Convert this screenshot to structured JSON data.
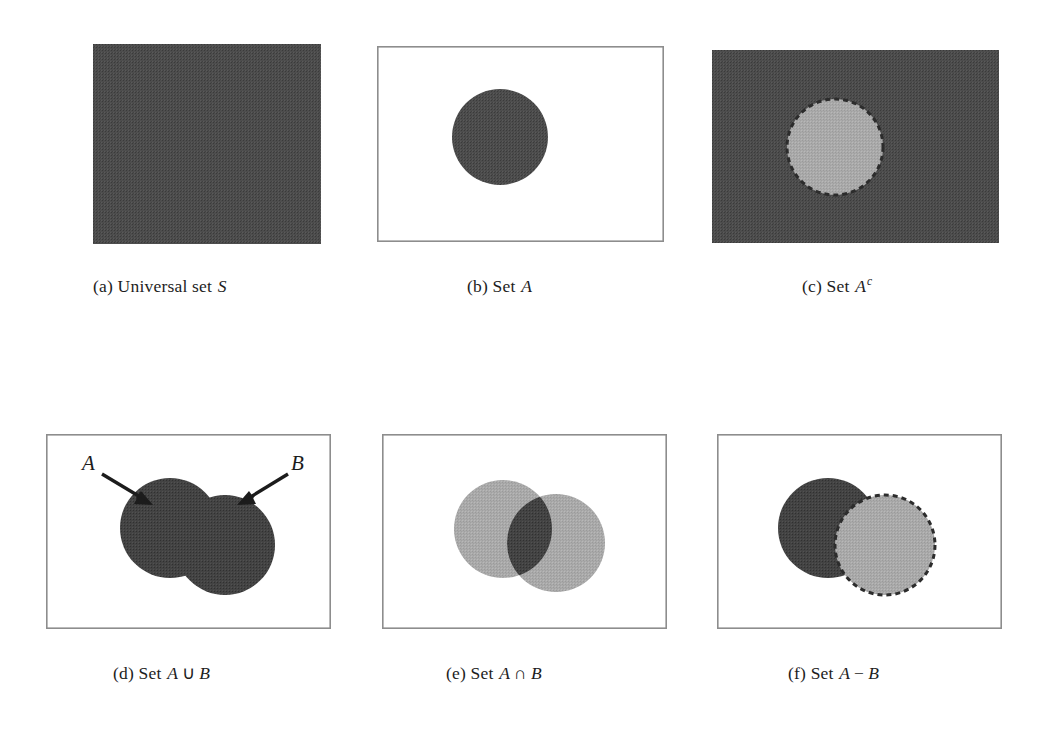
{
  "figure": {
    "panel_count": 6,
    "ink_colors": {
      "dark_fill": "#4a4a4a",
      "darker_fill": "#3d3d3d",
      "light_fill": "#a8a8a8",
      "frame": "#8f8f8f",
      "text": "#1d1d1d",
      "page": "#ffffff"
    },
    "panels": [
      {
        "key": "a",
        "caption_prefix": "(a)",
        "caption_text": "Universal set",
        "caption_symbol": "S",
        "description": "solid shaded rectangle representing the whole sample space",
        "shapes": [
          "filled-rectangle"
        ]
      },
      {
        "key": "b",
        "caption_prefix": "(b)",
        "caption_text": "Set",
        "caption_symbol": "A",
        "description": "white rectangle with one dark filled circle",
        "shapes": [
          "outlined-rectangle",
          "filled-circle-A"
        ]
      },
      {
        "key": "c",
        "caption_prefix": "(c)",
        "caption_text": "Set",
        "caption_symbol": "A",
        "caption_superscript": "c",
        "description": "shaded rectangle with a light circle cut out, dashed boundary",
        "shapes": [
          "filled-rectangle",
          "light-circle-dashed"
        ]
      },
      {
        "key": "d",
        "caption_prefix": "(d)",
        "caption_text": "Set",
        "caption_symbol": "A",
        "caption_operator": "∪",
        "caption_symbol2": "B",
        "description": "two overlapping circles both shaded dark (union), labelled with arrows",
        "shapes": [
          "outlined-rectangle",
          "filled-circle-A",
          "filled-circle-B",
          "arrow-A",
          "arrow-B"
        ],
        "annotations": [
          {
            "label": "A",
            "points_to": "left circle"
          },
          {
            "label": "B",
            "points_to": "right circle"
          }
        ]
      },
      {
        "key": "e",
        "caption_prefix": "(e)",
        "caption_text": "Set",
        "caption_symbol": "A",
        "caption_operator": "∩",
        "caption_symbol2": "B",
        "description": "two light circles with only the lens-shaped overlap shaded dark",
        "shapes": [
          "outlined-rectangle",
          "light-circle-A",
          "light-circle-B",
          "dark-lens-intersection"
        ]
      },
      {
        "key": "f",
        "caption_prefix": "(f)",
        "caption_text": "Set",
        "caption_symbol": "A",
        "caption_operator": "−",
        "caption_symbol2": "B",
        "description": "left circle shaded dark except where B overlaps; B drawn light with dashed left arc",
        "shapes": [
          "outlined-rectangle",
          "dark-circle-A-minus-B",
          "light-circle-B-dashed"
        ]
      }
    ]
  }
}
